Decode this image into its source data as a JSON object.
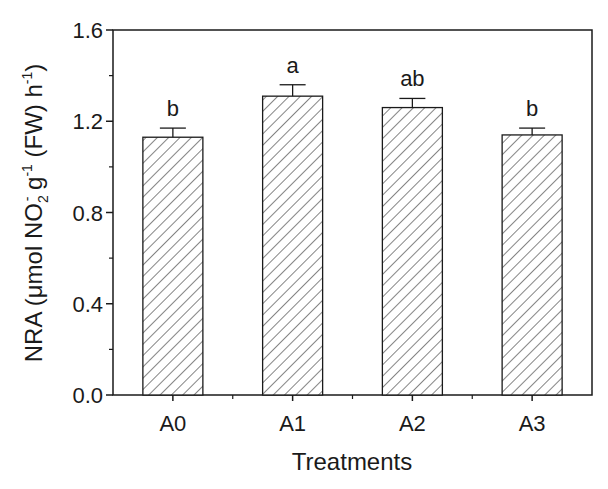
{
  "chart_data": {
    "type": "bar",
    "title": "",
    "xlabel": "Treatments",
    "ylabel": "NRA (μmol NO2- g-1 (FW) h-1)",
    "categories": [
      "A0",
      "A1",
      "A2",
      "A3"
    ],
    "values": [
      1.13,
      1.31,
      1.26,
      1.14
    ],
    "errors": [
      0.04,
      0.05,
      0.04,
      0.03
    ],
    "significance_letters": [
      "b",
      "a",
      "ab",
      "b"
    ],
    "ylim": [
      0.0,
      1.6
    ],
    "yticks": [
      "0.0",
      "0.4",
      "0.8",
      "1.2",
      "1.6"
    ],
    "minor_yticks": [
      0.2,
      0.6,
      1.0,
      1.4
    ],
    "grid": false,
    "legend": null,
    "bar_fill": "diagonal-hatch",
    "colors": {
      "axis": "#1a1a1a",
      "hatch": "#333333",
      "background": "#ffffff"
    }
  },
  "axis": {
    "ylabel_parts": {
      "main": "NRA (μmol NO",
      "sub": "2",
      "sup1": "-",
      "mid": " g",
      "sup2": "-1",
      "tail": " (FW) h",
      "sup3": "-1",
      "close": ")"
    }
  }
}
